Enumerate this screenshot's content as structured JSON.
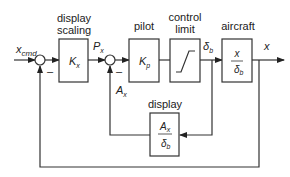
{
  "diagram": {
    "type": "block-diagram",
    "colors": {
      "line": "#333333",
      "background": "#ffffff"
    },
    "inputs": {
      "command": {
        "main": "x",
        "sub": "cmd"
      }
    },
    "outputs": {
      "output": "x"
    },
    "blocks": [
      {
        "id": "display-scaling",
        "title_line1": "display",
        "title_line2": "scaling",
        "gain_main": "K",
        "gain_sub": "x"
      },
      {
        "id": "pilot",
        "title": "pilot",
        "gain_main": "K",
        "gain_sub": "p"
      },
      {
        "id": "control-limit",
        "title_line1": "control",
        "title_line2": "limit",
        "content": "saturation"
      },
      {
        "id": "aircraft",
        "title": "aircraft",
        "num": "x",
        "den_main": "δ",
        "den_sub": "b"
      },
      {
        "id": "display",
        "title": "display",
        "num_main": "A",
        "num_sub": "x",
        "den_main": "δ",
        "den_sub": "b"
      }
    ],
    "signals": {
      "px": {
        "main": "P",
        "sub": "x"
      },
      "ax": {
        "main": "A",
        "sub": "x"
      },
      "delta_b": {
        "main": "δ",
        "sub": "b"
      }
    },
    "junction_signs": {
      "sum1_feedback": "–",
      "sum2_feedback": "–"
    }
  }
}
